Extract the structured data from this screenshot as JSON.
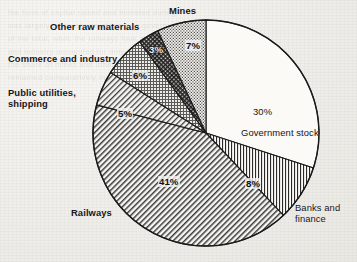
{
  "chart_data": {
    "type": "pie",
    "title": "",
    "categories": [
      "Government stock",
      "Banks and finance",
      "Railways",
      "Public utilities, shipping",
      "Commerce and industry",
      "Other raw materials",
      "Mines"
    ],
    "values": [
      30,
      8,
      41,
      5,
      6,
      3,
      7
    ],
    "unit": "%",
    "legend": "none",
    "grid": false,
    "slices": [
      {
        "label": "30%\nGovernment stock",
        "label_text": "Government stock",
        "pct_text": "30%",
        "value": 30,
        "fill": "plain",
        "placement": "inside"
      },
      {
        "label": "Banks and\nfinance",
        "label_text": "Banks and finance",
        "pct_text": "8%",
        "value": 8,
        "fill": "vertical",
        "placement": "outside-right"
      },
      {
        "label": "Railways",
        "label_text": "Railways",
        "pct_text": "41%",
        "value": 41,
        "fill": "diagonal",
        "placement": "outside-left"
      },
      {
        "label": "Public utilities,\nshipping",
        "label_text": "Public utilities, shipping",
        "pct_text": "5%",
        "value": 5,
        "fill": "diagonal-fine",
        "placement": "outside-left"
      },
      {
        "label": "Commerce and industry",
        "label_text": "Commerce and industry",
        "pct_text": "6%",
        "value": 6,
        "fill": "crosshatch",
        "placement": "outside-left"
      },
      {
        "label": "Other raw materials",
        "label_text": "Other raw materials",
        "pct_text": "3%",
        "value": 3,
        "fill": "crosshatch-dense",
        "placement": "outside-left"
      },
      {
        "label": "Mines",
        "label_text": "Mines",
        "pct_text": "7%",
        "value": 7,
        "fill": "stipple",
        "placement": "outside-top"
      }
    ],
    "colors": {
      "outline": "#1a1a1a",
      "paper": "#f2f1ee",
      "ink": "#16161a"
    }
  },
  "labels": {
    "government_stock": "Government stock",
    "government_stock_pct": "30%",
    "banks_finance": "Banks and\nfinance",
    "banks_finance_pct": "8%",
    "railways": "Railways",
    "railways_pct": "41%",
    "public_utilities": "Public utilities,\nshipping",
    "public_utilities_pct": "5%",
    "commerce_industry": "Commerce and industry",
    "commerce_industry_pct": "6%",
    "other_raw_materials": "Other raw materials",
    "other_raw_materials_pct": "3%",
    "mines": "Mines",
    "mines_pct": "7%"
  },
  "ghost_text": [
    "",
    "the form of capital raised and invested during",
    "was largely in the shape of loans to governments",
    "of the total, while the railways took a further",
    "and industry accounted for only a small",
    "",
    "",
    "",
    "",
    "",
    "",
    "",
    "",
    "",
    "",
    "",
    "",
    "",
    "the share of mines and other raw materials",
    "remained comparatively modest throughout"
  ]
}
